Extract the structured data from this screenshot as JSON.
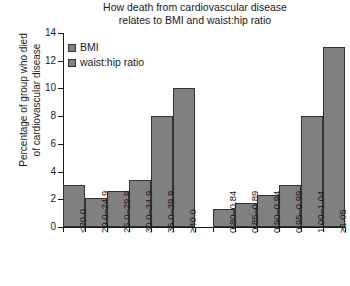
{
  "chart_data": {
    "type": "bar",
    "title": "How death from cardiovascular disease relates to BMI and waist:hip ratio",
    "title_line1": "How death from cardiovascular disease",
    "title_line2": "relates to BMI and waist:hip ratio",
    "xlabel": "",
    "ylabel": "Percentage of group who died of cardiovascular disease",
    "ylabel_line1": "Percentage of group who died",
    "ylabel_line2": "of cardiovascular disease",
    "ylim": [
      0,
      14
    ],
    "yticks": [
      0,
      2,
      4,
      6,
      8,
      10,
      12,
      14
    ],
    "grid": false,
    "legend_position": "top-left",
    "bar_color": "#808080",
    "bar_edge_color": "#333333",
    "legend": [
      {
        "label": "BMI",
        "color": "#808080"
      },
      {
        "label": "waist:hip ratio",
        "color": "#808080"
      }
    ],
    "groups": [
      {
        "name": "BMI",
        "categories": [
          "<20.0",
          "20.0–24.9",
          "25.0–29.9",
          "30.0–34.9",
          "35.0–39.9",
          "≥40.0"
        ],
        "values": [
          3.0,
          2.1,
          2.6,
          3.4,
          8.0,
          10.0
        ]
      },
      {
        "name": "waist:hip ratio",
        "categories": [
          "0.80–0.84",
          "0.85–0.89",
          "0.90–0.94",
          "0.95–0.99",
          "1.00–1.04",
          "≥1.05"
        ],
        "values": [
          1.3,
          1.7,
          2.3,
          3.0,
          8.0,
          13.0
        ]
      }
    ],
    "categories": [
      "<20.0",
      "20.0–24.9",
      "25.0–29.9",
      "30.0–34.9",
      "35.0–39.9",
      "≥40.0",
      "0.80–0.84",
      "0.85–0.89",
      "0.90–0.94",
      "0.95–0.99",
      "1.00–1.04",
      "≥1.05"
    ],
    "values": [
      3.0,
      2.1,
      2.6,
      3.4,
      8.0,
      10.0,
      1.3,
      1.7,
      2.3,
      3.0,
      8.0,
      13.0
    ]
  }
}
